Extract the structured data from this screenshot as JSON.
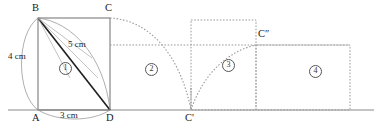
{
  "figure": {
    "ground_line": {
      "y": 110,
      "x_start": 8,
      "x_end": 374,
      "color": "#8a8a8a"
    },
    "colors": {
      "solid_stroke": "#6f6f6f",
      "dark_stroke": "#1f1f1f",
      "dotted_stroke": "#9a9a9a",
      "arc_stroke": "#8f8f8f",
      "text": "#1a1a1a"
    },
    "points": [
      {
        "id": "B",
        "label": "B",
        "x": 38,
        "y": 18,
        "label_x": 32,
        "label_y": 4
      },
      {
        "id": "C",
        "label": "C",
        "x": 110,
        "y": 18,
        "label_x": 105,
        "label_y": 4
      },
      {
        "id": "A",
        "label": "A",
        "x": 38,
        "y": 110,
        "label_x": 32,
        "label_y": 113
      },
      {
        "id": "D",
        "label": "D",
        "x": 110,
        "y": 110,
        "label_x": 106,
        "label_y": 113
      },
      {
        "id": "C1",
        "label": "C'",
        "x": 191,
        "y": 110,
        "label_x": 185,
        "label_y": 113
      },
      {
        "id": "C2",
        "label": "C″",
        "x": 256,
        "y": 45,
        "label_x": 258,
        "label_y": 30
      }
    ],
    "dimensions": [
      {
        "id": "height",
        "value": "4 cm",
        "x": 9,
        "y": 56
      },
      {
        "id": "hypotenuse",
        "value": "5 cm",
        "x": 69,
        "y": 44
      },
      {
        "id": "base",
        "value": "3 cm",
        "x": 61,
        "y": 112
      }
    ],
    "regions": [
      {
        "id": "r1",
        "label": "1",
        "x": 60,
        "y": 66
      },
      {
        "id": "r2",
        "label": "2",
        "x": 146,
        "y": 67
      },
      {
        "id": "r3",
        "label": "3",
        "x": 223,
        "y": 63
      },
      {
        "id": "r4",
        "label": "4",
        "x": 310,
        "y": 69
      }
    ],
    "rect1": {
      "x": 38,
      "y": 18,
      "w": 72,
      "h": 92,
      "style": "solid"
    },
    "rect3": {
      "x": 191,
      "y": 20,
      "w": 65,
      "h": 90,
      "style": "dotted"
    },
    "rect4": {
      "x": 256,
      "y": 45,
      "w": 94,
      "h": 65,
      "style": "dotted"
    },
    "guide_line": {
      "x1": 110,
      "y1": 45,
      "x2": 350,
      "y2": 45,
      "style": "dotted"
    },
    "diagonal": {
      "x1": 38,
      "y1": 18,
      "x2": 110,
      "y2": 110,
      "style": "solid-dark"
    },
    "arcs": [
      {
        "id": "arc-AB-left",
        "desc": "arc from B sweeping left to A",
        "d": "M 38 18 C 16 34, 16 94, 38 110"
      },
      {
        "id": "arc-BD-inner",
        "desc": "arc from B to D about A",
        "d": "M 38 18 C 72 22, 104 56, 110 110"
      },
      {
        "id": "arc-AD-bottom",
        "desc": "arc from A to D below baseline",
        "d": "M 38 110 C 58 122, 92 122, 110 110"
      },
      {
        "id": "locus-C-to-C1",
        "desc": "dotted locus of C from position 1 to C'",
        "d": "M 110 18 C 150 20, 180 55, 191 110"
      },
      {
        "id": "locus-C1-to-C2",
        "desc": "dotted locus of C' rising to C″",
        "d": "M 191 110 C 203 74, 228 51, 256 45"
      }
    ]
  }
}
